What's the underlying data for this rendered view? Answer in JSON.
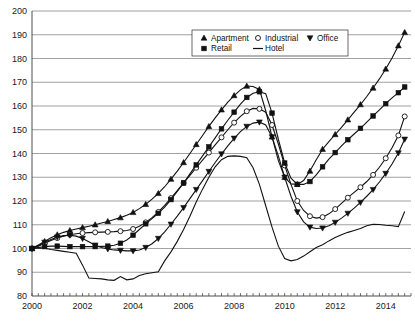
{
  "chart_data": {
    "type": "line",
    "title": "",
    "xlabel": "",
    "ylabel": "",
    "xlim": [
      2000.0,
      2015.0
    ],
    "ylim": [
      80,
      200
    ],
    "yticks": [
      80,
      90,
      100,
      110,
      120,
      130,
      140,
      150,
      160,
      170,
      180,
      190,
      200
    ],
    "xticks_labeled": [
      2000,
      2002,
      2004,
      2006,
      2008,
      2010,
      2012,
      2014
    ],
    "xtick_interval_minor": 0.25,
    "grid": "horizontal",
    "legend_position": "top-center",
    "legend_entries": [
      {
        "name": "Apartment",
        "marker": "triangle-up-filled"
      },
      {
        "name": "Industrial",
        "marker": "circle-open"
      },
      {
        "name": "Office",
        "marker": "triangle-down-filled"
      },
      {
        "name": "Retail",
        "marker": "square-filled"
      },
      {
        "name": "Hotel",
        "marker": "line-only"
      }
    ],
    "x": [
      2000.0,
      2000.25,
      2000.5,
      2000.75,
      2001.0,
      2001.25,
      2001.5,
      2001.75,
      2002.0,
      2002.25,
      2002.5,
      2002.75,
      2003.0,
      2003.25,
      2003.5,
      2003.75,
      2004.0,
      2004.25,
      2004.5,
      2004.75,
      2005.0,
      2005.25,
      2005.5,
      2005.75,
      2006.0,
      2006.25,
      2006.5,
      2006.75,
      2007.0,
      2007.25,
      2007.5,
      2007.75,
      2008.0,
      2008.25,
      2008.5,
      2008.75,
      2009.0,
      2009.25,
      2009.5,
      2009.75,
      2010.0,
      2010.25,
      2010.5,
      2010.75,
      2011.0,
      2011.25,
      2011.5,
      2011.75,
      2012.0,
      2012.25,
      2012.5,
      2012.75,
      2013.0,
      2013.25,
      2013.5,
      2013.75,
      2014.0,
      2014.25,
      2014.5,
      2014.75
    ],
    "series": [
      {
        "name": "Apartment",
        "marker": "triangle-up-filled",
        "values": [
          100.0,
          101.5,
          103.0,
          104.5,
          105.8,
          106.8,
          107.6,
          108.2,
          108.8,
          109.4,
          110.0,
          110.7,
          111.4,
          112.2,
          113.0,
          114.0,
          115.2,
          116.8,
          118.6,
          120.8,
          123.2,
          126.0,
          129.2,
          132.6,
          136.2,
          140.0,
          143.8,
          147.6,
          151.4,
          155.0,
          158.4,
          161.6,
          164.4,
          166.8,
          168.4,
          168.2,
          167.0,
          158.0,
          147.0,
          137.0,
          130.0,
          127.2,
          127.0,
          128.6,
          132.6,
          137.4,
          141.8,
          145.0,
          148.0,
          151.0,
          154.2,
          157.4,
          160.6,
          164.0,
          167.6,
          171.4,
          175.6,
          180.2,
          185.4,
          191.0
        ]
      },
      {
        "name": "Industrial",
        "marker": "circle-open",
        "values": [
          100.0,
          101.0,
          102.2,
          103.4,
          104.4,
          105.2,
          105.8,
          106.2,
          106.5,
          106.7,
          106.8,
          106.9,
          107.0,
          107.1,
          107.3,
          107.6,
          108.2,
          109.4,
          111.0,
          113.0,
          115.4,
          118.2,
          121.2,
          124.4,
          127.6,
          130.8,
          134.0,
          137.2,
          140.4,
          143.6,
          146.8,
          150.0,
          153.0,
          155.6,
          157.8,
          159.0,
          158.8,
          157.4,
          152.0,
          144.0,
          135.0,
          127.0,
          120.0,
          116.0,
          113.6,
          112.8,
          113.2,
          114.6,
          116.6,
          119.0,
          121.4,
          123.6,
          125.8,
          128.2,
          131.0,
          134.2,
          138.0,
          142.4,
          147.6,
          155.6
        ]
      },
      {
        "name": "Office",
        "marker": "triangle-down-filled",
        "values": [
          100.0,
          101.2,
          102.6,
          103.8,
          104.8,
          105.4,
          105.6,
          105.2,
          104.2,
          102.8,
          101.4,
          100.4,
          99.8,
          99.4,
          99.2,
          99.0,
          99.0,
          99.4,
          100.4,
          102.0,
          104.2,
          107.0,
          110.2,
          113.6,
          117.2,
          121.0,
          124.8,
          128.6,
          132.4,
          136.2,
          139.8,
          143.2,
          146.4,
          149.2,
          151.4,
          152.8,
          153.2,
          152.0,
          147.0,
          139.0,
          130.0,
          122.0,
          115.4,
          111.2,
          109.0,
          108.4,
          108.6,
          109.6,
          111.0,
          112.8,
          114.8,
          117.0,
          119.4,
          122.0,
          124.8,
          128.0,
          131.6,
          135.6,
          140.2,
          146.0
        ]
      },
      {
        "name": "Retail",
        "marker": "square-filled",
        "values": [
          100.0,
          100.4,
          100.8,
          101.0,
          101.0,
          100.9,
          100.8,
          100.8,
          100.8,
          100.8,
          100.8,
          100.9,
          101.0,
          101.4,
          102.2,
          103.6,
          105.6,
          108.0,
          110.4,
          112.6,
          114.8,
          117.4,
          120.6,
          124.0,
          127.6,
          131.4,
          135.2,
          139.0,
          142.8,
          146.6,
          150.4,
          154.0,
          157.4,
          160.8,
          163.6,
          165.4,
          166.0,
          165.2,
          157.0,
          146.0,
          136.0,
          129.6,
          127.0,
          127.0,
          128.2,
          131.0,
          134.4,
          137.6,
          140.4,
          143.2,
          145.8,
          148.2,
          150.6,
          153.2,
          155.8,
          158.4,
          161.0,
          163.4,
          165.6,
          168.0
        ]
      },
      {
        "name": "Hotel",
        "marker": "line-only",
        "values": [
          100.0,
          100.2,
          100.1,
          99.6,
          99.2,
          98.8,
          98.4,
          98.0,
          93.0,
          87.6,
          87.4,
          87.2,
          86.8,
          86.6,
          88.2,
          86.8,
          87.2,
          88.6,
          89.4,
          89.8,
          90.2,
          94.8,
          98.6,
          103.0,
          108.0,
          113.6,
          119.6,
          125.0,
          130.0,
          134.4,
          137.4,
          138.8,
          139.0,
          138.8,
          138.2,
          134.0,
          127.0,
          118.0,
          109.0,
          101.0,
          95.8,
          94.8,
          95.4,
          96.8,
          98.6,
          100.4,
          101.6,
          103.2,
          104.6,
          105.8,
          106.8,
          107.6,
          108.4,
          109.6,
          110.2,
          110.1,
          109.8,
          109.6,
          109.2,
          115.6
        ]
      }
    ]
  }
}
